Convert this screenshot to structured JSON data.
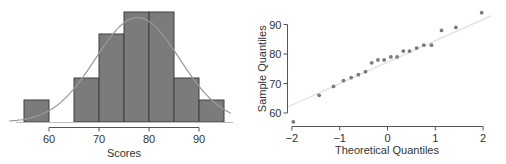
{
  "chart_data": [
    {
      "type": "bar",
      "subtype": "histogram",
      "title": "",
      "xlabel": "Scores",
      "ylabel": "",
      "bins": [
        [
          55,
          60
        ],
        [
          60,
          65
        ],
        [
          65,
          70
        ],
        [
          70,
          75
        ],
        [
          75,
          80
        ],
        [
          80,
          85
        ],
        [
          85,
          90
        ],
        [
          90,
          95
        ]
      ],
      "values": [
        1,
        0,
        2,
        4,
        5,
        5,
        2,
        1
      ],
      "xticks": [
        60,
        70,
        80,
        90
      ],
      "xlim": [
        52,
        97
      ],
      "overlay": {
        "type": "normal_curve",
        "mean": 77.7,
        "sd": 8.4
      },
      "grid": false,
      "colors": {
        "bar_fill": "#7b7b7b",
        "bar_edge": "#3f3f3f",
        "curve": "#9a9a9a",
        "axis": "#555555"
      }
    },
    {
      "type": "scatter",
      "subtype": "normal_qq_plot",
      "title": "",
      "xlabel": "Theoretical Quantiles",
      "ylabel": "Sample Quantiles",
      "x": [
        -1.97,
        -1.43,
        -1.13,
        -0.92,
        -0.76,
        -0.61,
        -0.46,
        -0.33,
        -0.2,
        -0.07,
        0.07,
        0.2,
        0.33,
        0.46,
        0.61,
        0.76,
        0.92,
        1.13,
        1.43,
        1.97
      ],
      "y": [
        57,
        66,
        69,
        71,
        72,
        73,
        74,
        77,
        78,
        78,
        79,
        79,
        81,
        81,
        82,
        83,
        83,
        88,
        89,
        94
      ],
      "reference_line": {
        "x": [
          -2,
          2
        ],
        "y": [
          62.4,
          92.3
        ]
      },
      "xticks": [
        -2,
        -1,
        0,
        1,
        2
      ],
      "xtick_labels": [
        "−2",
        "−1",
        "0",
        "1",
        "2"
      ],
      "yticks": [
        60,
        70,
        80,
        90
      ],
      "xlim": [
        -2.1,
        2.2
      ],
      "ylim": [
        56,
        96
      ],
      "grid": false,
      "colors": {
        "point": "#7a7a7a",
        "line": "#e4e4e4",
        "axis": "#555555"
      }
    }
  ]
}
